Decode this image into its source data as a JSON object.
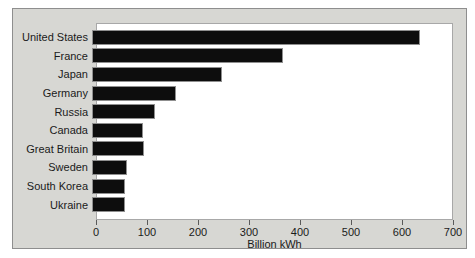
{
  "chart_data": {
    "type": "bar",
    "orientation": "horizontal",
    "title": "",
    "xlabel": "Billion kWh",
    "ylabel": "",
    "categories": [
      "United States",
      "France",
      "Japan",
      "Germany",
      "Russia",
      "Canada",
      "Great Britain",
      "Sweden",
      "South Korea",
      "Ukraine"
    ],
    "values": [
      640,
      370,
      250,
      160,
      120,
      97,
      99,
      64,
      60,
      60
    ],
    "xlim": [
      0,
      700
    ],
    "xticks": [
      0,
      100,
      200,
      300,
      400,
      500,
      600,
      700
    ],
    "grid": false,
    "legend": false,
    "colors": {
      "bar": "#0d0d0d",
      "panel_background": "#d7d7d3",
      "panel_border": "#8e8e8e",
      "plot_background": "#ffffff",
      "plot_border": "#a8a8a8",
      "text": "#1a1a1a"
    }
  }
}
